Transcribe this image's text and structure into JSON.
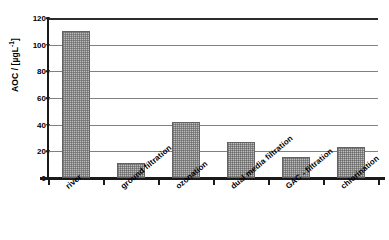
{
  "chart_data": {
    "type": "bar",
    "title": "",
    "xlabel": "",
    "ylabel": "AOC / [µgL",
    "ylabel_sup": "-1",
    "ylabel_tail": "]",
    "categories": [
      "river",
      "ground filtration",
      "ozonation",
      "dual media filtration",
      "GAC - filtration",
      "chlorination"
    ],
    "values": [
      110,
      11,
      42,
      27,
      16,
      23
    ],
    "ylim": [
      0,
      120
    ],
    "ytick_values": [
      0,
      20,
      40,
      60,
      80,
      100,
      120
    ],
    "ytick_labels": [
      "0",
      "20",
      "40",
      "60",
      "80",
      "100",
      "120"
    ],
    "grid": "horizontal",
    "legend": "none",
    "bar_fill_color": "#bdbdbd",
    "bar_edge_color": "#636363",
    "gridline_color": "#808080",
    "axis_color": "#1a1a1a",
    "background_color": "#ffffff"
  }
}
